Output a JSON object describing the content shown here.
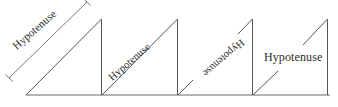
{
  "figure": {
    "background_color": "#ffffff",
    "line_color": "#555555",
    "text_color": "#2b2b2b",
    "width": 338,
    "height": 107,
    "baseline": {
      "y": 95,
      "x_start": 26,
      "x_end": 330
    },
    "triangles": [
      {
        "id": 1,
        "label": "Hypotenuse",
        "label_orientation": "rotated-along-hypotenuse-upright",
        "label_rotation_deg": -41,
        "has_dimension_line": true,
        "line_interrupted": false,
        "vertices": {
          "bottom_left_x": 26,
          "bottom_right_x": 101,
          "apex_y": 19
        }
      },
      {
        "id": 2,
        "label": "Hypotenuse",
        "label_orientation": "rotated-on-hypotenuse-line",
        "label_rotation_deg": -41,
        "has_dimension_line": false,
        "line_interrupted": false,
        "vertices": {
          "bottom_left_x": 102,
          "bottom_right_x": 177,
          "apex_y": 19
        }
      },
      {
        "id": 3,
        "label": "Hypotenuse",
        "label_orientation": "rotated-upside-down",
        "label_rotation_deg": 139,
        "has_dimension_line": false,
        "line_interrupted": true,
        "vertices": {
          "bottom_left_x": 178,
          "bottom_right_x": 252,
          "apex_y": 19
        }
      },
      {
        "id": 4,
        "label": "Hypotenuse",
        "label_orientation": "horizontal",
        "label_rotation_deg": 0,
        "has_dimension_line": false,
        "line_interrupted": true,
        "vertices": {
          "bottom_left_x": 253,
          "bottom_right_x": 327,
          "apex_y": 19
        }
      }
    ]
  }
}
